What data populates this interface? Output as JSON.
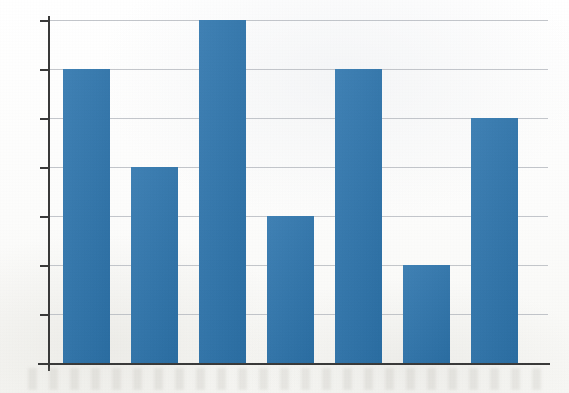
{
  "chart_data": {
    "type": "bar",
    "title": "",
    "subtitle": "",
    "xlabel": "",
    "ylabel": "",
    "categories": [
      "1",
      "2",
      "3",
      "4",
      "5",
      "6",
      "7"
    ],
    "values": [
      6,
      4,
      7,
      3,
      6,
      2,
      5
    ],
    "ylim": [
      0,
      7
    ],
    "y_ticks": [
      0,
      1,
      2,
      3,
      4,
      5,
      6,
      7
    ],
    "y_tick_labels": [
      "",
      "",
      "",
      "",
      "",
      "",
      "",
      ""
    ],
    "x_tick_labels": [
      "",
      "",
      "",
      "",
      "",
      "",
      ""
    ],
    "grid": true,
    "grid_axis": "y",
    "legend": false,
    "legend_position": "none",
    "annotations": [],
    "series": [
      {
        "name": "Series 1",
        "values": [
          6,
          4,
          7,
          3,
          6,
          2,
          5
        ],
        "color": "#2e75ad"
      }
    ]
  },
  "style": {
    "bar_color": "#2e75ad",
    "gridline_color": "#b9bcc2",
    "axis_color": "#3a3a3a",
    "background_color": "#fdfdfd"
  },
  "geometry": {
    "baseline_y": 363,
    "top_y": 20,
    "plot_left": 48,
    "plot_right": 548,
    "bar_width": 47,
    "bar_pitch": 68,
    "first_bar_left": 63,
    "tick_count": 8,
    "tick_length": 9
  },
  "labels": {
    "chart_description": "Vertical bar chart with seven blue bars and horizontal gridlines",
    "y_axis_name": "y-axis",
    "x_axis_name": "x-axis"
  }
}
